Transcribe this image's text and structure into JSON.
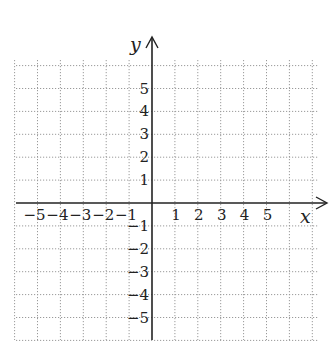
{
  "chart_data": {
    "type": "coordinate-grid",
    "title": "",
    "xlabel": "x",
    "ylabel": "y",
    "xlim": [
      -6,
      7
    ],
    "ylim": [
      -6,
      6
    ],
    "grid": true,
    "grid_style": "dotted",
    "x_ticks": [
      -5,
      -4,
      -3,
      -2,
      -1,
      1,
      2,
      3,
      4,
      5
    ],
    "y_ticks": [
      5,
      4,
      3,
      2,
      1,
      -1,
      -2,
      -3,
      -4,
      -5
    ],
    "x_tick_labels": [
      "−5",
      "−4",
      "−3",
      "−2",
      "−1",
      "1",
      "2",
      "3",
      "4",
      "5"
    ],
    "y_tick_labels": [
      "5",
      "4",
      "3",
      "2",
      "1",
      "−1",
      "−2",
      "−3",
      "−4",
      "−5"
    ],
    "series": []
  },
  "colors": {
    "axis": "#222222",
    "grid": "#9a9a9a",
    "background": "#ffffff"
  },
  "geometry": {
    "origin_x": 152,
    "origin_y": 203,
    "unit": 22.9,
    "grid_left": 16,
    "grid_right": 318,
    "grid_top": 60,
    "grid_bottom": 340
  }
}
